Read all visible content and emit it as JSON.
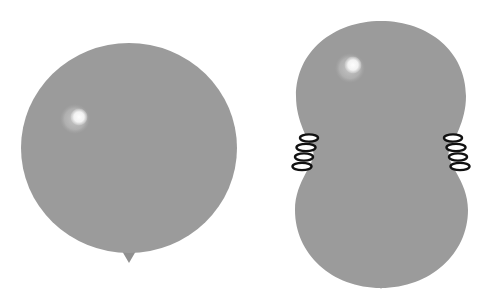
{
  "scene": {
    "title": "Two gray balloons illustration",
    "width": 486,
    "height": 303,
    "background_color": "#ffffff",
    "figure_count": 2
  },
  "colors": {
    "balloon_gray": "#9b9b9b",
    "highlight_outer": "#bdbdbd",
    "highlight_inner": "#f2f2f2",
    "knot_gray": "#8f8f8f",
    "coil_stroke": "#111111",
    "coil_fill": "#ffffff",
    "background": "#ffffff"
  },
  "balloons": [
    {
      "id": "balloon-left",
      "label": "Round balloon",
      "shape": "round",
      "cx": 129,
      "cy": 148,
      "rx": 108,
      "ry": 105,
      "fill": "#9b9b9b",
      "highlight": {
        "outer_cx": 75,
        "outer_cy": 119,
        "outer_r": 15,
        "inner_cx": 79,
        "inner_cy": 117,
        "inner_r": 8.5
      },
      "knot": {
        "points": "122,251 136,251 129,263",
        "fill": "#8f8f8f"
      },
      "clips": []
    },
    {
      "id": "balloon-right",
      "label": "Pinched figure-eight balloon",
      "shape": "peanut",
      "fill": "#9b9b9b",
      "path": "M 381 21 C 429 21 466 52 466 96 C 466 122 453 140 449 151 C 445 163 468 180 468 210 C 468 254 430 288 381 288 C 332 288 295 254 295 210 C 295 180 317 163 313 151 C 309 140 296 122 296 96 C 296 52 333 21 381 21 Z",
      "highlight": {
        "outer_cx": 350,
        "outer_cy": 68,
        "outer_r": 15,
        "inner_cx": 353,
        "inner_cy": 65,
        "inner_r": 8.5
      },
      "knot": {
        "points": "374,277 388,277 381,289",
        "fill": "#8f8f8f"
      },
      "clips": [
        {
          "id": "clip-left",
          "label": "Left spring clip",
          "side": "left",
          "x": 306,
          "y": 152,
          "coil_count": 4
        },
        {
          "id": "clip-right",
          "label": "Right spring clip",
          "side": "right",
          "x": 456,
          "y": 152,
          "coil_count": 4
        }
      ]
    }
  ]
}
